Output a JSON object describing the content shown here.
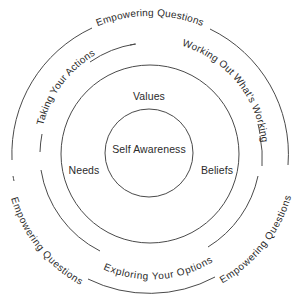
{
  "diagram": {
    "center": {
      "label": "Self Awareness"
    },
    "inner_ring": {
      "labels": {
        "top": "Values",
        "left": "Needs",
        "right": "Beliefs"
      }
    },
    "middle_ring": {
      "labels": {
        "upper_left": "Taking Your Actions",
        "upper_right": "Working Out What's Working",
        "bottom": "Exploring Your Options"
      }
    },
    "outer_ring": {
      "labels": {
        "top": "Empowering Questions",
        "lower_left": "Empowering Questions",
        "lower_right": "Empowering Questions"
      }
    },
    "colors": {
      "stroke": "#4a4a4a",
      "text": "#2b2b2b",
      "background": "#ffffff"
    }
  }
}
